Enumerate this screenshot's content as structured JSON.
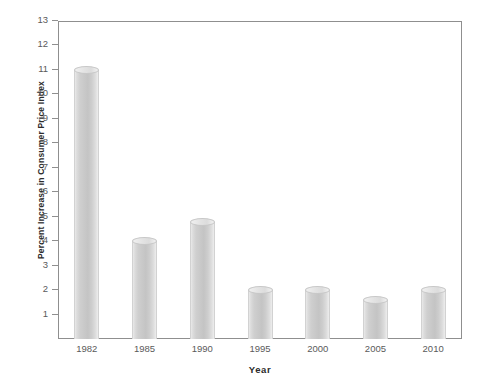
{
  "chart_data": {
    "type": "bar",
    "title": "",
    "xlabel": "Year",
    "ylabel": "Percent Increase in Consumer Price Index",
    "categories": [
      "1982",
      "1985",
      "1990",
      "1995",
      "2000",
      "2005",
      "2010"
    ],
    "values": [
      11.0,
      4.0,
      4.8,
      2.0,
      2.0,
      1.6,
      2.0
    ],
    "ylim": [
      0,
      13
    ],
    "xlim_note": "categorical",
    "y_ticks": [
      1,
      2,
      3,
      4,
      5,
      6,
      7,
      8,
      9,
      10,
      11,
      12,
      13
    ],
    "y_tick_labels": [
      "1",
      "2",
      "3",
      "4",
      "5",
      "6",
      "7",
      "8",
      "9",
      "10",
      "11",
      "12",
      "13"
    ],
    "grid": false,
    "legend": null,
    "series": [
      {
        "name": "Percent Increase in Consumer Price Index",
        "values": [
          11.0,
          4.0,
          4.8,
          2.0,
          2.0,
          1.6,
          2.0
        ]
      }
    ],
    "bar_style": "3d-cylinder",
    "colors": {
      "bar_fill_light": "#ededed",
      "bar_fill_mid": "#c4c4c4",
      "bar_edge": "#c8c8c8",
      "axis_line": "#8f8f8f",
      "tick_text": "#5a5a5a",
      "axis_title_text": "#2b2b2b",
      "background": "#ffffff"
    }
  }
}
